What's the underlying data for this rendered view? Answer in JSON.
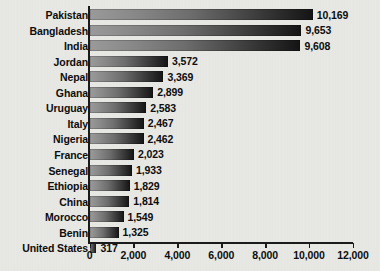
{
  "chart_data": {
    "type": "bar",
    "orientation": "horizontal",
    "title": "",
    "xlabel": "",
    "ylabel": "",
    "categories": [
      "Pakistan",
      "Bangladesh",
      "India",
      "Jordan",
      "Nepal",
      "Ghana",
      "Uruguay",
      "Italy",
      "Nigeria",
      "France",
      "Senegal",
      "Ethiopia",
      "China",
      "Morocco",
      "Benin",
      "United States"
    ],
    "values": [
      10169,
      9653,
      9608,
      3572,
      3369,
      2899,
      2583,
      2467,
      2462,
      2023,
      1933,
      1829,
      1814,
      1549,
      1325,
      317
    ],
    "value_labels": [
      "10,169",
      "9,653",
      "9,608",
      "3,572",
      "3,369",
      "2,899",
      "2,583",
      "2,467",
      "2,462",
      "2,023",
      "1,933",
      "1,829",
      "1,814",
      "1,549",
      "1,325",
      "317"
    ],
    "xlim": [
      0,
      12000
    ],
    "xticks": [
      0,
      2000,
      4000,
      6000,
      8000,
      10000,
      12000
    ],
    "xtick_labels": [
      "0",
      "2,000",
      "4,000",
      "6,000",
      "8,000",
      "10,000",
      "12,000"
    ],
    "grid": false,
    "legend": null,
    "bar_fill": "gradient-gray-to-black",
    "colors": {
      "background": "#e9e9e6",
      "text": "#0d0d0d",
      "axis": "#1a1a1a",
      "bar_light": "#9a9a9a",
      "bar_dark": "#141414"
    }
  }
}
